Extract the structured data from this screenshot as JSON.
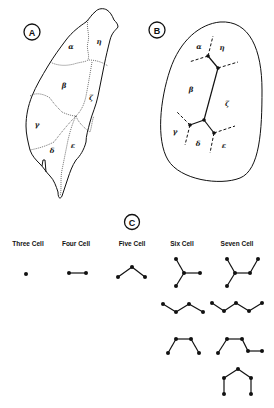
{
  "panels": {
    "A": {
      "label": "A",
      "description": "Map of Taiwan divided into seven cell regions"
    },
    "B": {
      "label": "B",
      "description": "Schematic of the cell adjacency network"
    },
    "C": {
      "label": "C",
      "description": "Possible connected cell configurations"
    }
  },
  "regions": {
    "alpha": "α",
    "beta": "β",
    "gamma": "γ",
    "delta": "δ",
    "epsilon": "ε",
    "zeta": "ζ",
    "eta": "η"
  },
  "configurations": {
    "titles": [
      "Three Cell",
      "Four Cell",
      "Five Cell",
      "Six Cell",
      "Seven Cell"
    ]
  },
  "colors": {
    "ink": "#111111",
    "background": "#ffffff"
  }
}
